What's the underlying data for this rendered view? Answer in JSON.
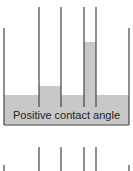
{
  "diagram": {
    "top_panel": {
      "label": "Positive contact angle",
      "liquid_color": "#c8c8c8",
      "wall_color": "#444444",
      "tubes": [
        {
          "name": "wide-tube",
          "x_left": 39,
          "x_right": 61,
          "liquid_top": 86
        },
        {
          "name": "medium-tube",
          "x_left": 84,
          "x_right": 96,
          "liquid_top": 42
        }
      ],
      "container": {
        "x_left": 4,
        "x_right": 129,
        "top": 28,
        "bottom": 125,
        "liquid_top": 95
      }
    },
    "bottom_panel": {
      "label": ""
    }
  }
}
